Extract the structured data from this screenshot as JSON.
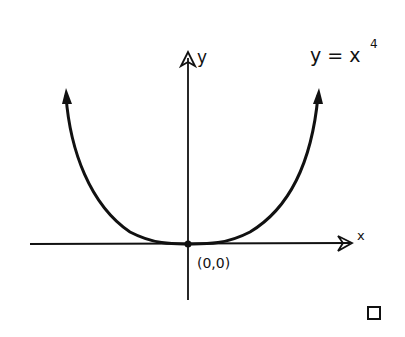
{
  "diagram": {
    "equation_label": "y = x",
    "equation_exponent": "4",
    "y_axis_label": "y",
    "x_axis_label": "x",
    "origin_label": "(0,0)",
    "end_marker": "□",
    "stroke_color": "#111111",
    "background": "#ffffff"
  }
}
